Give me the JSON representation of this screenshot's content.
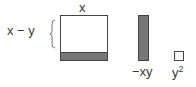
{
  "labels": {
    "top_x": "x",
    "side": "x − y",
    "bar": "−xy",
    "small_base": "y",
    "small_exp": "2"
  },
  "colors": {
    "fill": "#777777",
    "stroke": "#444444",
    "text": "#3a3a3a"
  }
}
